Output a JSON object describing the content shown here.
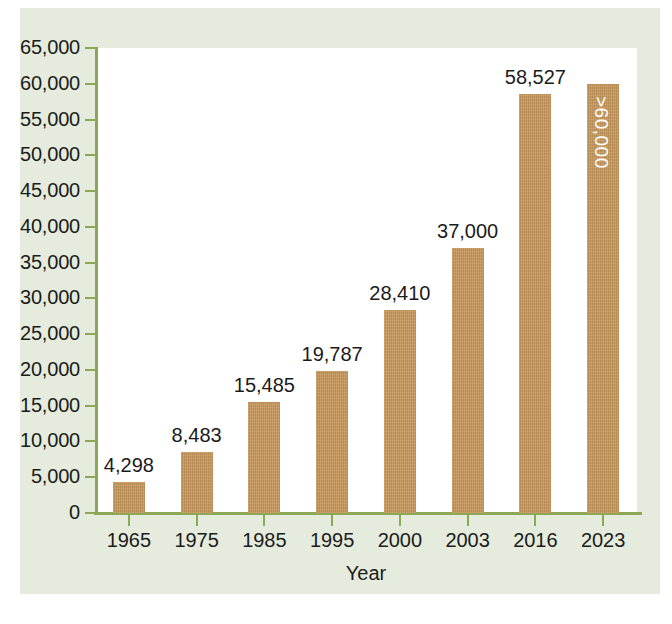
{
  "chart_data": {
    "type": "bar",
    "title": "",
    "subtitle": "",
    "xlabel": "Year",
    "ylabel": "",
    "categories": [
      "1965",
      "1975",
      "1985",
      "1995",
      "2000",
      "2003",
      "2016",
      "2023"
    ],
    "values": [
      4298,
      8483,
      15485,
      19787,
      28410,
      37000,
      58527,
      60000
    ],
    "value_labels": [
      "4,298",
      "8,483",
      "15,485",
      "19,787",
      "28,410",
      "37,000",
      "58,527",
      ">60,000"
    ],
    "label_placement": [
      "above",
      "above",
      "above",
      "above",
      "above",
      "above",
      "above",
      "inside-rotated"
    ],
    "ylim": [
      0,
      65000
    ],
    "ytick_values": [
      0,
      5000,
      10000,
      15000,
      20000,
      25000,
      30000,
      35000,
      40000,
      45000,
      50000,
      55000,
      60000,
      65000
    ],
    "ytick_labels": [
      "0",
      "5,000",
      "10,000",
      "15,000",
      "20,000",
      "25,000",
      "30,000",
      "35,000",
      "40,000",
      "45,000",
      "50,000",
      "55,000",
      "60,000",
      "65,000"
    ],
    "grid": false,
    "legend": null,
    "legend_position": "none",
    "bar_color": "#c9995d",
    "axis_color": "#8ca854",
    "plot_background": "#ffffff",
    "figure_background": "#e5ecdd",
    "text_color": "#1b1b1b",
    "inside_label_color": "#ffffff"
  },
  "axes": {
    "x_axis_title": "Year"
  }
}
